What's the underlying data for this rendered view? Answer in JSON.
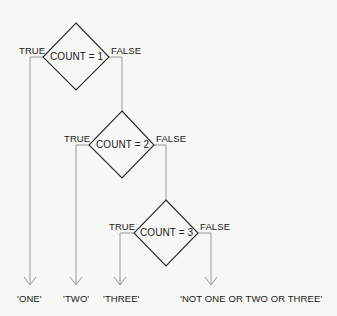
{
  "diagram": {
    "type": "flowchart",
    "decisions": [
      {
        "id": "d1",
        "condition": "COUNT = 1",
        "true_label": "TRUE",
        "false_label": "FALSE"
      },
      {
        "id": "d2",
        "condition": "COUNT = 2",
        "true_label": "TRUE",
        "false_label": "FALSE"
      },
      {
        "id": "d3",
        "condition": "COUNT = 3",
        "true_label": "TRUE",
        "false_label": "FALSE"
      }
    ],
    "outputs": [
      {
        "id": "o1",
        "text": "'ONE'"
      },
      {
        "id": "o2",
        "text": "'TWO'"
      },
      {
        "id": "o3",
        "text": "'THREE'"
      },
      {
        "id": "o4",
        "text": "'NOT ONE OR TWO OR THREE'"
      }
    ],
    "edges": [
      {
        "from": "d1",
        "branch": "TRUE",
        "to": "o1"
      },
      {
        "from": "d1",
        "branch": "FALSE",
        "to": "d2"
      },
      {
        "from": "d2",
        "branch": "TRUE",
        "to": "o2"
      },
      {
        "from": "d2",
        "branch": "FALSE",
        "to": "d3"
      },
      {
        "from": "d3",
        "branch": "TRUE",
        "to": "o3"
      },
      {
        "from": "d3",
        "branch": "FALSE",
        "to": "o4"
      }
    ],
    "colors": {
      "diamond_stroke": "#2a2a2a",
      "line": "#9a9a9a",
      "background": "#f7f7f5"
    }
  }
}
